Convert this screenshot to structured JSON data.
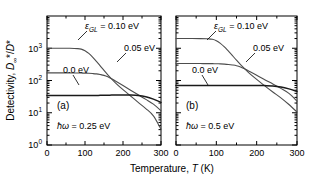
{
  "figure": {
    "axis": {
      "xlabel_main": "Temperature,",
      "xlabel_var": "T",
      "xlabel_unit": "(K)",
      "ylabel_main": "Detectivity,",
      "ylabel_var1": "D",
      "ylabel_sub1": "∞",
      "ylabel_star1": "*",
      "ylabel_slash": "/",
      "ylabel_var2": "D",
      "ylabel_star2": "*",
      "x_ticks": [
        "0",
        "100",
        "200",
        "300"
      ],
      "y_ticks": [
        "10",
        "10",
        "10",
        "10"
      ],
      "y_exponents": [
        "0",
        "1",
        "2",
        "3"
      ],
      "line_color": "#000000",
      "curve_color": "#4d4d4d"
    },
    "panels": [
      {
        "tag": "(a)",
        "condition_var": "ħω",
        "condition_value": "= 0.25 eV",
        "labels": {
          "eps_var": "ε",
          "eps_sub": "GL",
          "eps_value": "= 0.10 eV",
          "mid_value": "0.05 eV",
          "low_value": "0.0 eV"
        }
      },
      {
        "tag": "(b)",
        "condition_var": "ħω",
        "condition_value": "= 0.5 eV",
        "labels": {
          "eps_var": "ε",
          "eps_sub": "GL",
          "eps_value": "= 0.10 eV",
          "mid_value": "0.05 eV",
          "low_value": "0.0 eV"
        }
      }
    ]
  },
  "chart_data": {
    "type": "line",
    "title": "",
    "xlabel": "Temperature, T (K)",
    "ylabel": "Detectivity, D_inf*/D*",
    "xlim": [
      0,
      300
    ],
    "ylim": [
      1,
      10000
    ],
    "yscale": "log",
    "grid": false,
    "legend": "inline-annotations",
    "x": [
      0,
      20,
      40,
      60,
      80,
      90,
      100,
      110,
      120,
      130,
      140,
      150,
      160,
      170,
      180,
      200,
      220,
      240,
      260,
      280,
      300
    ],
    "panels": [
      {
        "tag": "(a)",
        "photon_energy_eV": 0.25,
        "series": [
          {
            "name": "0.10 eV",
            "eps_GL_eV": 0.1,
            "values": [
              1000,
              1000,
              1000,
              995,
              975,
              940,
              840,
              690,
              530,
              390,
              285,
              205,
              150,
              112,
              85,
              52,
              33,
              21,
              13.5,
              8.0,
              3.1
            ]
          },
          {
            "name": "0.05 eV",
            "eps_GL_eV": 0.05,
            "values": [
              172,
              172,
              172,
              172,
              171,
              170,
              169,
              167,
              164,
              160,
              153,
              144,
              130,
              113,
              97,
              70,
              50,
              36,
              26,
              18.5,
              11.5
            ]
          },
          {
            "name": "0.0 eV",
            "eps_GL_eV": 0.0,
            "values": [
              34,
              34,
              34,
              34,
              34,
              34,
              34,
              34,
              34.2,
              34.4,
              34.6,
              34.8,
              35,
              35.2,
              35.4,
              35.6,
              35.5,
              34.5,
              31.5,
              26.5,
              21
            ]
          }
        ]
      },
      {
        "tag": "(b)",
        "photon_energy_eV": 0.5,
        "series": [
          {
            "name": "0.10 eV",
            "eps_GL_eV": 0.1,
            "values": [
              2000,
              2000,
              2000,
              1990,
              1960,
              1900,
              1720,
              1420,
              1100,
              810,
              590,
              425,
              310,
              232,
              176,
              108,
              68,
              44,
              29,
              18,
              10.5
            ]
          },
          {
            "name": "0.05 eV",
            "eps_GL_eV": 0.05,
            "values": [
              335,
              335,
              335,
              335,
              334,
              333,
              331,
              328,
              323,
              315,
              303,
              287,
              262,
              230,
              198,
              146,
              106,
              78,
              57,
              40,
              23
            ]
          },
          {
            "name": "0.0 eV",
            "eps_GL_eV": 0.0,
            "values": [
              70,
              70,
              70,
              70,
              70,
              70,
              70,
              70,
              70,
              70,
              70,
              70,
              70,
              70,
              70,
              70,
              69.5,
              68,
              63,
              55,
              46
            ]
          }
        ]
      }
    ]
  }
}
